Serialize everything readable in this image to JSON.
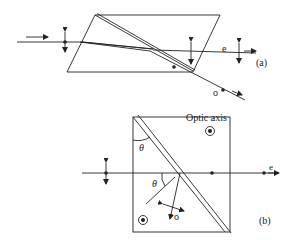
{
  "figure": {
    "panel_a": {
      "label": "(a)",
      "ray_e_label": "e",
      "ray_o_label": "o"
    },
    "panel_b": {
      "label": "(b)",
      "optic_axis_label": "Optic axis",
      "angle_label_top": "θ",
      "angle_label_mid": "θ",
      "ray_e_label": "e",
      "ray_o_label": "o"
    },
    "colors": {
      "line": "#222222",
      "background": "#ffffff"
    }
  }
}
